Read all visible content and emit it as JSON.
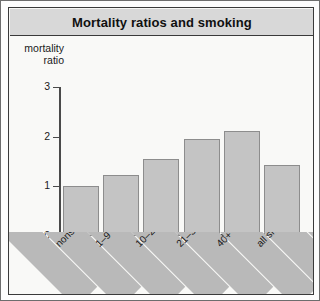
{
  "chart_data": {
    "type": "bar",
    "title": "Mortality ratios and smoking",
    "xlabel": "cigarette consumption per day",
    "ylabel": "mortality ratio",
    "ylabel_line1": "mortality",
    "ylabel_line2": "ratio",
    "categories": [
      "nonsmokers",
      "1–9",
      "10–20",
      "21–39",
      "40+",
      "all smokers"
    ],
    "values": [
      1.0,
      1.22,
      1.55,
      1.96,
      2.12,
      1.43
    ],
    "yticks": [
      0,
      1,
      2,
      3
    ],
    "ytick_labels": [
      "0",
      "1",
      "2",
      "3"
    ],
    "ylim": [
      0,
      3
    ],
    "grid": false,
    "legend": "none",
    "bar_color": "#c4c4c4",
    "bar_border_color": "#8d8d8d",
    "axis_color": "#4a4a4a",
    "title_bar_color": "#d8d8d8",
    "band_color": "#b9b9b9",
    "plot_background": "#f9f9f7",
    "frame_border_color": "#3a3a3a"
  }
}
